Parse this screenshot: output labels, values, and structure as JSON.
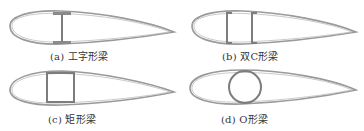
{
  "figure": {
    "panels": [
      {
        "id": "a",
        "label": "(a) 工字形梁",
        "spar_type": "I-beam"
      },
      {
        "id": "b",
        "label": "(b) 双C形梁",
        "spar_type": "double-C"
      },
      {
        "id": "c",
        "label": "(c) 矩形梁",
        "spar_type": "rectangular box"
      },
      {
        "id": "d",
        "label": "(d) O形梁",
        "spar_type": "circular"
      }
    ],
    "colors": {
      "airfoil_outline": "#9a9a9a",
      "spar": "#7d7d7d",
      "text": "#333333",
      "background": "#ffffff"
    }
  }
}
